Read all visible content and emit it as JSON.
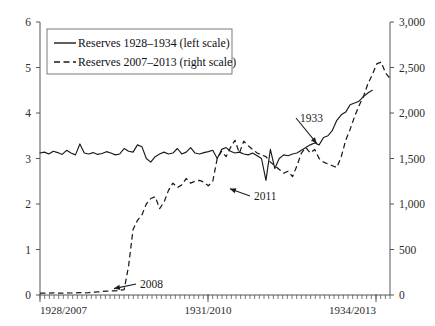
{
  "chart_data": {
    "type": "line",
    "title": "",
    "subtitle": "",
    "xlabel": "",
    "ylabel": "",
    "y2label": "",
    "grid": false,
    "legend_position": "top-left",
    "x": {
      "tick_labels": [
        "1928/2007",
        "1931/2010",
        "1934/2013"
      ],
      "tick_positions_months": [
        0,
        36,
        72
      ],
      "range_months": [
        0,
        75
      ],
      "minor_tick_interval_months": 1
    },
    "yaxis_left": {
      "tick_labels": [
        "0",
        "1",
        "2",
        "3",
        "4",
        "5",
        "6"
      ],
      "values": [
        0,
        1,
        2,
        3,
        4,
        5,
        6
      ],
      "ylim": [
        0,
        6
      ]
    },
    "yaxis_right": {
      "tick_labels": [
        "0",
        "500",
        "1,000",
        "1,500",
        "2,000",
        "2,500",
        "3,000"
      ],
      "values": [
        0,
        500,
        1000,
        1500,
        2000,
        2500,
        3000
      ],
      "ylim": [
        0,
        3000
      ]
    },
    "series": [
      {
        "name": "Reserves 1928–1934 (left scale)",
        "axis": "left",
        "style": "solid",
        "color": "#1a1a1a",
        "values": [
          3.12,
          3.14,
          3.1,
          3.16,
          3.13,
          3.09,
          3.18,
          3.12,
          3.08,
          3.32,
          3.12,
          3.1,
          3.13,
          3.09,
          3.11,
          3.15,
          3.12,
          3.08,
          3.1,
          3.22,
          3.16,
          3.14,
          3.3,
          3.26,
          3.0,
          2.92,
          3.04,
          3.1,
          3.14,
          3.1,
          3.12,
          3.22,
          3.1,
          3.14,
          3.24,
          3.12,
          3.1,
          3.13,
          3.15,
          3.18,
          3.0,
          3.2,
          3.24,
          3.16,
          3.12,
          3.14,
          3.1,
          3.08,
          3.12,
          3.06,
          3.0,
          2.52,
          3.2,
          2.78,
          3.0,
          3.08,
          3.06,
          3.1,
          3.12,
          3.18,
          3.24,
          3.3,
          3.34,
          3.3,
          3.46,
          3.5,
          3.62,
          3.84,
          3.96,
          4.02,
          4.18,
          4.22,
          4.26,
          4.36,
          4.44,
          4.5
        ]
      },
      {
        "name": "Reserves 2007–2013 (right scale)",
        "axis": "right",
        "style": "dashed",
        "color": "#1a1a1a",
        "values": [
          20,
          22,
          20,
          24,
          22,
          20,
          24,
          22,
          24,
          26,
          24,
          26,
          30,
          34,
          38,
          42,
          44,
          46,
          50,
          60,
          320,
          720,
          820,
          880,
          1000,
          1060,
          1080,
          950,
          1020,
          1150,
          1230,
          1180,
          1210,
          1280,
          1230,
          1250,
          1260,
          1240,
          1200,
          1250,
          1500,
          1580,
          1520,
          1620,
          1700,
          1560,
          1690,
          1640,
          1600,
          1560,
          1540,
          1520,
          1460,
          1420,
          1380,
          1340,
          1360,
          1300,
          1420,
          1560,
          1620,
          1560,
          1600,
          1500,
          1460,
          1440,
          1420,
          1400,
          1520,
          1700,
          1820,
          1960,
          2080,
          2180,
          2320,
          2420,
          2540,
          2560,
          2440,
          2380
        ]
      }
    ],
    "annotations": [
      {
        "label": "1933",
        "series": "solid",
        "x_px": 300,
        "y_px": 122
      },
      {
        "label": "2011",
        "series": "dashed",
        "x_px": 254,
        "y_px": 200
      },
      {
        "label": "2008",
        "series": "dashed",
        "x_px": 140,
        "y_px": 288
      }
    ],
    "legend": [
      {
        "label": "Reserves 1928–1934 (left scale)",
        "style": "solid"
      },
      {
        "label": "Reserves 2007–2013 (right scale)",
        "style": "dashed"
      }
    ]
  }
}
